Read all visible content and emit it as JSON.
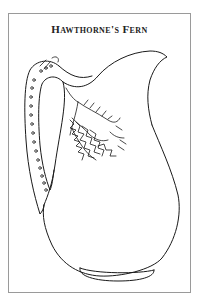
{
  "plate": {
    "title": "Hawthorne's Fern",
    "subject": "pitcher-illustration",
    "colors": {
      "line": "#1a1a1a",
      "frame": "#9a9a9a",
      "background": "#ffffff"
    }
  }
}
